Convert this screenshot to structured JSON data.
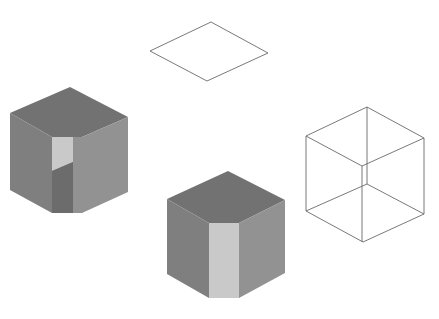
{
  "figure": {
    "width": 439,
    "height": 319,
    "background": "#ffffff"
  },
  "colors": {
    "top_face": "#727272",
    "left_face": "#7f7f7f",
    "right_face": "#929292",
    "highlight": "#c9c9c9",
    "notch_shadow": "#6c6c6c",
    "wire_stroke": "#6a6a6a"
  },
  "shapes": [
    {
      "id": "rhombus-outline",
      "type": "wireframe-square",
      "points": [
        [
          211,
          22
        ],
        [
          268,
          53
        ],
        [
          207,
          81
        ],
        [
          150,
          51
        ]
      ]
    },
    {
      "id": "solid-cube-with-notch",
      "type": "shaded-solid",
      "top": [
        [
          70,
          87
        ],
        [
          128,
          117
        ],
        [
          82,
          137
        ],
        [
          73,
          137
        ],
        [
          52,
          137
        ],
        [
          10,
          113
        ]
      ],
      "left": [
        [
          10,
          113
        ],
        [
          52,
          137
        ],
        [
          52,
          213
        ],
        [
          10,
          190
        ]
      ],
      "front_strip": [
        [
          52,
          137
        ],
        [
          82,
          137
        ],
        [
          82,
          213
        ],
        [
          52,
          213
        ]
      ],
      "right": [
        [
          82,
          137
        ],
        [
          128,
          117
        ],
        [
          128,
          192
        ],
        [
          82,
          213
        ]
      ],
      "notch_light": [
        [
          52,
          137
        ],
        [
          73,
          137
        ],
        [
          73,
          162
        ],
        [
          52,
          171
        ]
      ],
      "notch_dark": [
        [
          52,
          171
        ],
        [
          73,
          162
        ],
        [
          73,
          213
        ],
        [
          52,
          213
        ]
      ]
    },
    {
      "id": "solid-cube-with-strip",
      "type": "shaded-solid",
      "top": [
        [
          228,
          171
        ],
        [
          285,
          200
        ],
        [
          239,
          223
        ],
        [
          209,
          223
        ],
        [
          167,
          199
        ]
      ],
      "left": [
        [
          167,
          199
        ],
        [
          209,
          223
        ],
        [
          209,
          298
        ],
        [
          167,
          274
        ]
      ],
      "strip": [
        [
          209,
          223
        ],
        [
          239,
          223
        ],
        [
          239,
          298
        ],
        [
          209,
          298
        ]
      ],
      "right": [
        [
          239,
          223
        ],
        [
          285,
          200
        ],
        [
          285,
          273
        ],
        [
          239,
          298
        ]
      ]
    },
    {
      "id": "wireframe-cube",
      "type": "wireframe-cube",
      "outer": [
        [
          367,
          107
        ],
        [
          424,
          138
        ],
        [
          424,
          214
        ],
        [
          363,
          242
        ],
        [
          306,
          211
        ],
        [
          306,
          136
        ]
      ],
      "front_top": [
        [
          306,
          136
        ],
        [
          362,
          166
        ],
        [
          424,
          138
        ]
      ],
      "front_edge": [
        [
          362,
          166
        ],
        [
          362,
          242
        ]
      ],
      "back_edge": [
        [
          367,
          107
        ],
        [
          367,
          184
        ]
      ],
      "back_bottom": [
        [
          306,
          211
        ],
        [
          367,
          184
        ],
        [
          424,
          214
        ]
      ]
    }
  ]
}
